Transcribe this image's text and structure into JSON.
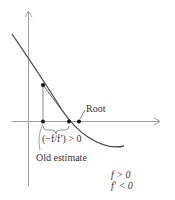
{
  "figure": {
    "type": "newton-method-diagram",
    "labels": {
      "root": "Root",
      "step": "(−f/f′) > 0",
      "old_estimate": "Old estimate",
      "cond1": "f > 0",
      "cond2": "f′ < 0"
    },
    "colors": {
      "axis": "#9a9a9a",
      "curve": "#4a4a4a",
      "tangent": "#7a7a7a",
      "point": "#111111",
      "text": "#333333"
    }
  }
}
